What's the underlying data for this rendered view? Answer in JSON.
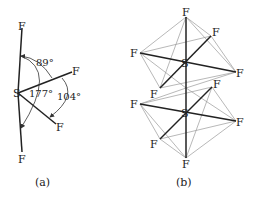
{
  "panel_a": {
    "caption": "(a)",
    "central_atom": "S",
    "ligand_label": "F",
    "angles": {
      "axial_equatorial": "89°",
      "axial_axial": "177°",
      "equatorial_equatorial": "104°"
    }
  },
  "panel_b": {
    "caption": "(b)",
    "central_atom": "S",
    "ligand_label": "F"
  }
}
